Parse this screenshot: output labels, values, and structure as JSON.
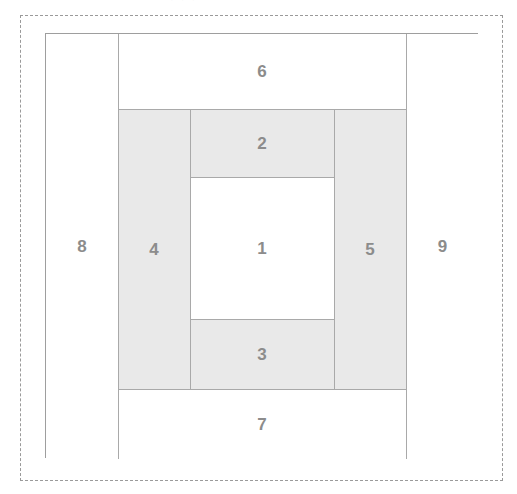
{
  "figure": {
    "title": "",
    "background_color": "#ffffff",
    "dashed_frame_color": "#9a9a9a",
    "box_border_color": "#9e9e9e",
    "gray_fill_color": "#e9e9e9",
    "white_fill_color": "#ffffff",
    "label_color": "#8c8c8c",
    "top_remnant_text": "· · ·"
  },
  "regions": [
    {
      "id": "region-1",
      "label": "1",
      "fill": "white",
      "role": "center-cell",
      "x": 144,
      "y": 143,
      "width": 144,
      "height": 142
    },
    {
      "id": "region-2",
      "label": "2",
      "fill": "gray",
      "role": "top-center-band",
      "x": 144,
      "y": 75,
      "width": 144,
      "height": 68
    },
    {
      "id": "region-3",
      "label": "3",
      "fill": "gray",
      "role": "bottom-center-band",
      "x": 144,
      "y": 285,
      "width": 144,
      "height": 70
    },
    {
      "id": "region-4",
      "label": "4",
      "fill": "gray",
      "role": "left-inner-band",
      "x": 72,
      "y": 75,
      "width": 72,
      "height": 280
    },
    {
      "id": "region-5",
      "label": "5",
      "fill": "gray",
      "role": "right-inner-band",
      "x": 288,
      "y": 75,
      "width": 72,
      "height": 280
    },
    {
      "id": "region-6",
      "label": "6",
      "fill": "white",
      "role": "top-outer-band",
      "x": 72,
      "y": 0,
      "width": 288,
      "height": 75
    },
    {
      "id": "region-7",
      "label": "7",
      "fill": "white",
      "role": "bottom-outer-band",
      "x": 72,
      "y": 355,
      "width": 288,
      "height": 70
    },
    {
      "id": "region-8",
      "label": "8",
      "fill": "white",
      "role": "left-outer-band",
      "x": 0,
      "y": 0,
      "width": 72,
      "height": 425
    },
    {
      "id": "region-9",
      "label": "9",
      "fill": "white",
      "role": "right-outer-band",
      "x": 360,
      "y": 0,
      "width": 73,
      "height": 425
    }
  ]
}
